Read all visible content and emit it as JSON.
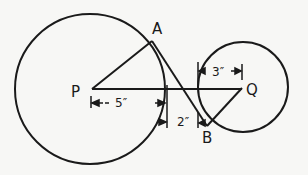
{
  "diagram": {
    "type": "geometry",
    "points": {
      "P": {
        "label": "P",
        "x": 90,
        "y": 89
      },
      "Q": {
        "label": "Q",
        "x": 242,
        "y": 87
      },
      "A": {
        "label": "A",
        "x": 152,
        "y": 42
      },
      "B": {
        "label": "B",
        "x": 207,
        "y": 128
      }
    },
    "circles": [
      {
        "center": "P",
        "radius_px": 75
      },
      {
        "center": "Q",
        "radius_px": 45
      }
    ],
    "segments": [
      {
        "from": "P",
        "to": "A"
      },
      {
        "from": "A",
        "to": "B"
      },
      {
        "from": "Q",
        "to": "B"
      },
      {
        "from": "P",
        "to": "Q"
      }
    ],
    "dimensions": [
      {
        "label": "5″",
        "meaning": "distance from P to edge of circle P region"
      },
      {
        "label": "2″",
        "meaning": "gap between circles"
      },
      {
        "label": "3″",
        "meaning": "radius of circle Q"
      }
    ],
    "stroke_color": "#1a1a1a",
    "background_color": "#f7f7f5"
  }
}
